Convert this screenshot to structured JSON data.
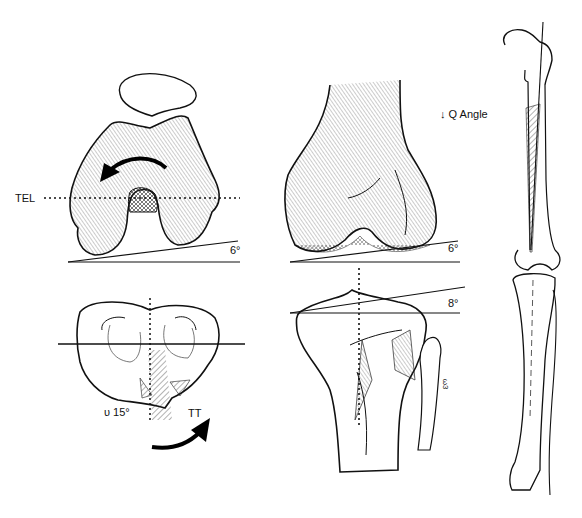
{
  "figure": {
    "panels": [
      {
        "id": "femur-axial",
        "description": "Distal femur, axial/sunrise view with patella above"
      },
      {
        "id": "tibia-axial",
        "description": "Proximal tibia plateau, axial view"
      },
      {
        "id": "femur-anterior",
        "description": "Distal femur, anterior view"
      },
      {
        "id": "tibia-anterior",
        "description": "Proximal tibia and fibula, anterior view"
      },
      {
        "id": "whole-leg",
        "description": "Full lower limb skeleton, femur and tibia/fibula"
      }
    ],
    "labels": {
      "tel": "TEL",
      "femur_axial_angle": "6°",
      "tibia_rotation": "υ 15°",
      "tt": "TT",
      "femur_anterior_angle": "6°",
      "tibia_anterior_angle": "8°",
      "q_angle": "↓ Q Angle",
      "small_annotation": "ω3"
    }
  }
}
